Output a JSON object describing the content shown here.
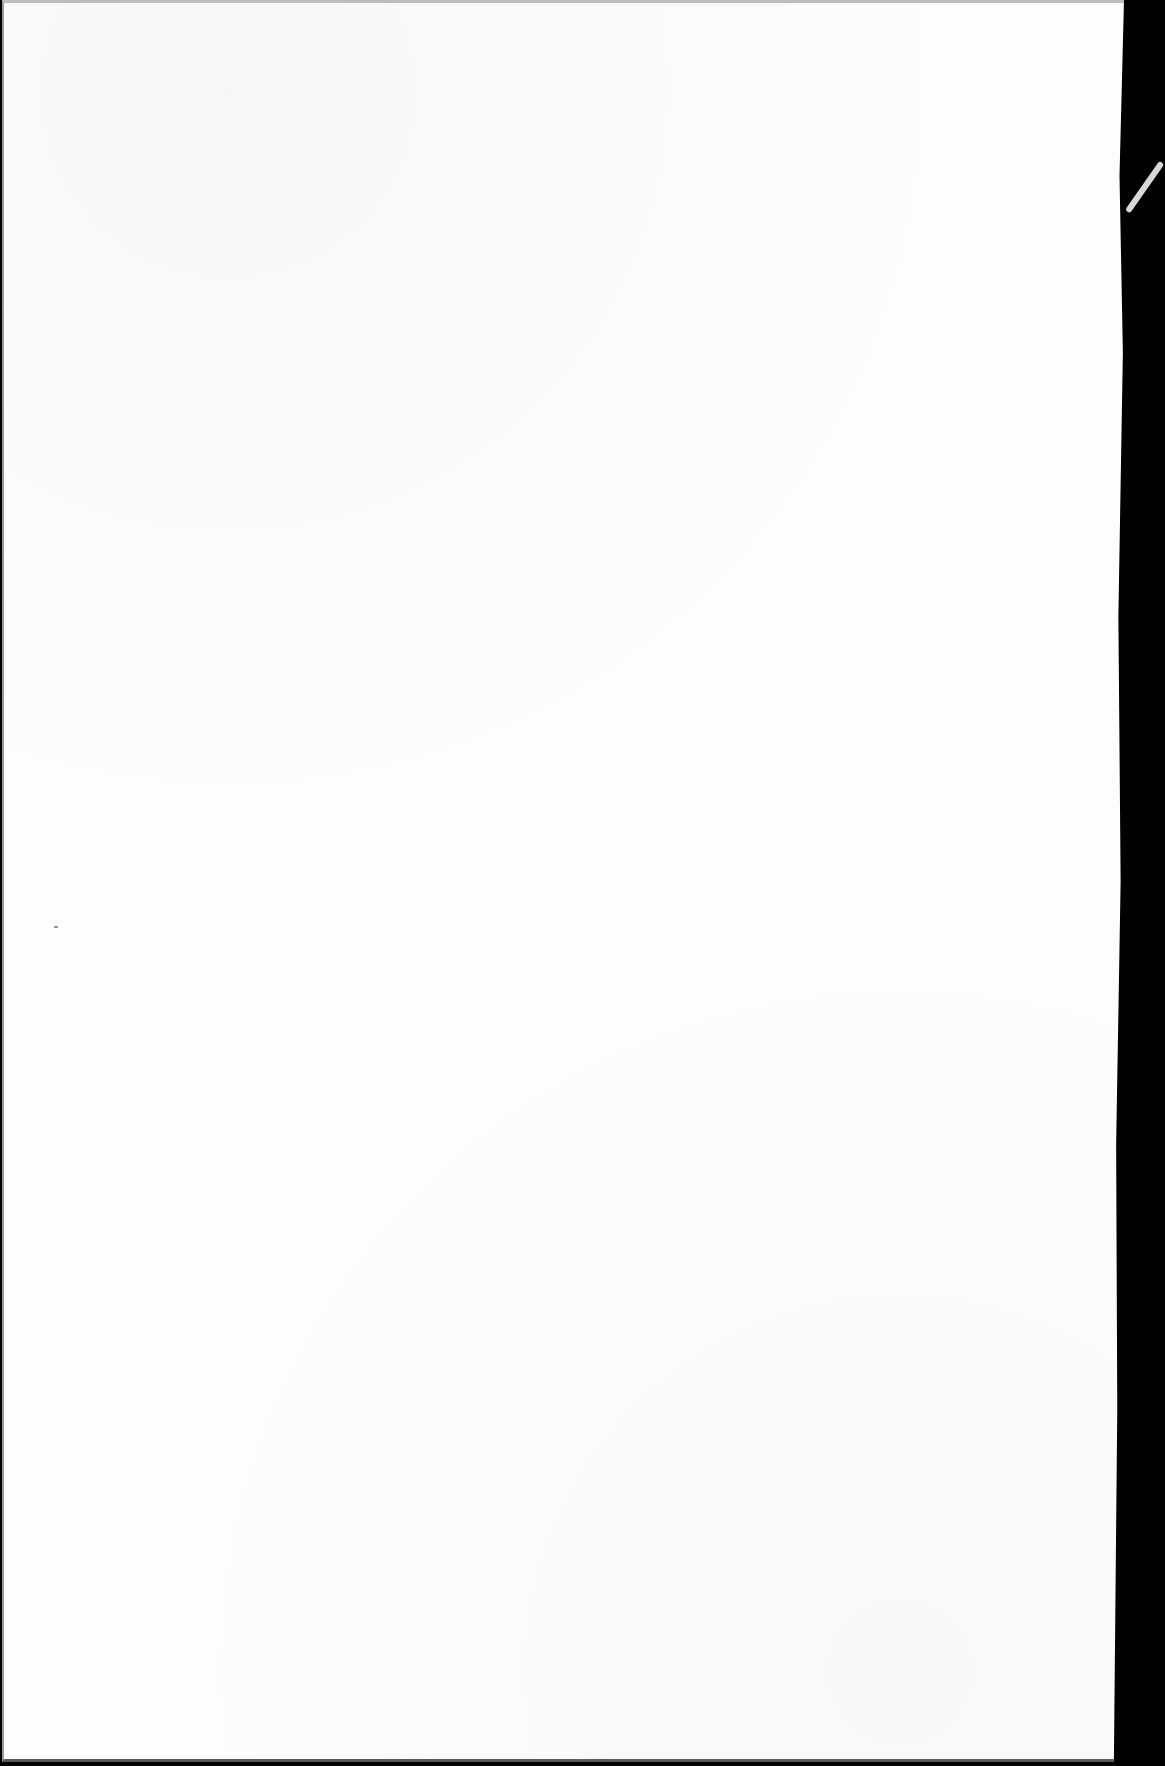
{
  "document": {
    "type": "scanned-page",
    "content": "",
    "colors": {
      "paper": "#fdfdfd",
      "background": "#000000",
      "edge_shadow": "#5a5a5a"
    }
  }
}
